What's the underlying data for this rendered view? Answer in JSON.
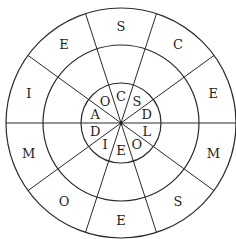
{
  "diagram": {
    "type": "concentric-letter-wheel",
    "center": [
      121,
      123
    ],
    "radii": {
      "outer": 115,
      "middle": 78,
      "inner": 40
    },
    "sector_count": 10,
    "spoke_offset_deg": 18,
    "colors": {
      "line": "#2a2a2a",
      "text": "#1e1e1e",
      "background": "#ffffff"
    },
    "outer_ring": {
      "description": "Outer ring letters, clockwise starting from top sector",
      "letters": [
        "S",
        "C",
        "E",
        "M",
        "S",
        "E",
        "O",
        "M",
        "I",
        "E"
      ],
      "label_radius": 97
    },
    "middle_ring": {
      "description": "Middle ring (empty cells)",
      "letters": [
        "",
        "",
        "",
        "",
        "",
        "",
        "",
        "",
        "",
        ""
      ]
    },
    "inner_ring": {
      "description": "Inner ring letters, clockwise starting from top sector",
      "letters": [
        "C",
        "S",
        "D",
        "L",
        "O",
        "E",
        "I",
        "D",
        "A",
        "O"
      ],
      "label_radius": 27
    }
  }
}
